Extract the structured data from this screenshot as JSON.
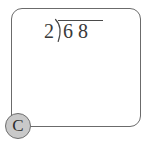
{
  "canvas": {
    "width": 149,
    "height": 149,
    "background_color": "#ffffff"
  },
  "card": {
    "name": "worksheet-card",
    "border_color": "#6b6b6b",
    "fill_color": "#ffffff",
    "corner_radius_px": 11
  },
  "problem": {
    "type": "long-division",
    "divisor": "2",
    "bracket_glyph": "division-bracket",
    "dividend": "6 8",
    "dividend_digits": [
      "6",
      "8"
    ],
    "quotient": "",
    "plain_text": "2)68",
    "ink_color": "#3a3a3a"
  },
  "badge": {
    "label": "C",
    "fill_color": "#c9c9c9",
    "border_color": "#6e6e6e",
    "text_color": "#2e2e2e",
    "position": "bottom-left"
  }
}
